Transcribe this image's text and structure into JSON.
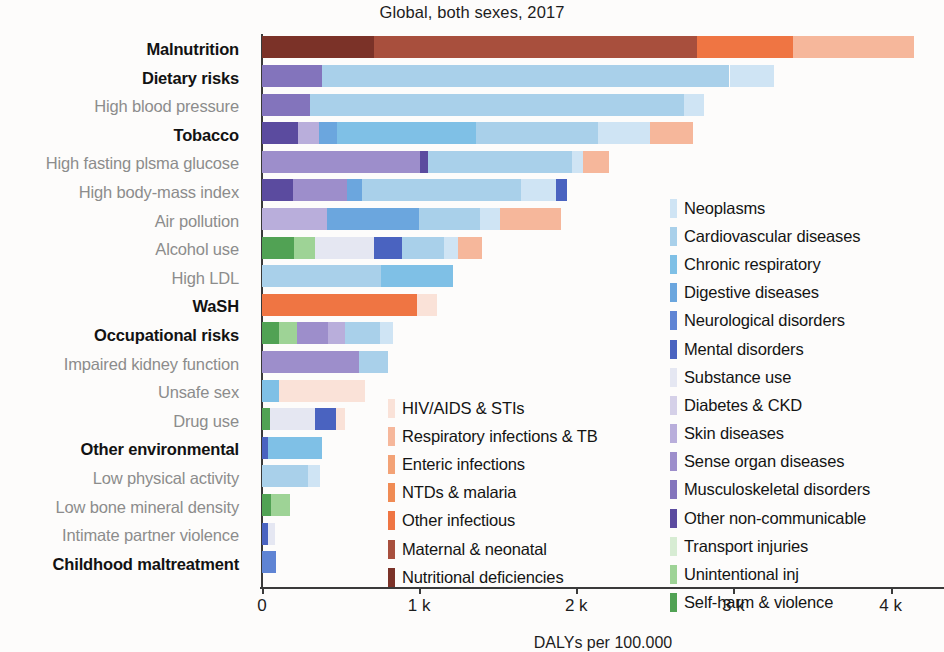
{
  "chart_data": {
    "type": "bar",
    "orientation": "horizontal",
    "stacked": true,
    "title": "Global, both sexes, 2017",
    "xlabel": "DALYs per 100.000",
    "ylabel": "",
    "xlim": [
      0,
      4340
    ],
    "xticks": [
      0,
      1000,
      2000,
      3000,
      4000
    ],
    "xticklabels": [
      "0",
      "1 k",
      "2 k",
      "3 k",
      "4 k"
    ],
    "grid": false,
    "categories": [
      "Malnutrition",
      "Dietary risks",
      "High blood pressure",
      "Tobacco",
      "High fasting plsma glucose",
      "High body-mass index",
      "Air pollution",
      "Alcohol use",
      "High LDL",
      "WaSH",
      "Occupational risks",
      "Impaired kidney function",
      "Unsafe sex",
      "Drug use",
      "Other environmental",
      "Low physical activity",
      "Low bone mineral density",
      "Intimate partner violence",
      "Childhood maltreatment"
    ],
    "category_emphasis": [
      true,
      true,
      false,
      true,
      false,
      false,
      false,
      false,
      false,
      true,
      true,
      false,
      false,
      false,
      true,
      false,
      false,
      false,
      true
    ],
    "totals": [
      4150,
      3255,
      2810,
      2740,
      2210,
      1940,
      1900,
      1400,
      1215,
      1115,
      835,
      805,
      655,
      530,
      385,
      370,
      180,
      85,
      90
    ],
    "series": [
      {
        "name": "HIV/AIDS & STIs",
        "color": "#fae2d8"
      },
      {
        "name": "Respiratory infections & TB",
        "color": "#f6b79b"
      },
      {
        "name": "Enteric infections",
        "color": "#f3a276"
      },
      {
        "name": "NTDs & malaria",
        "color": "#f08b54"
      },
      {
        "name": "Other infectious",
        "color": "#ef7543"
      },
      {
        "name": "Maternal & neonatal",
        "color": "#a84f3d"
      },
      {
        "name": "Nutritional deficiencies",
        "color": "#7b3228"
      },
      {
        "name": "Neoplasms",
        "color": "#cfe4f4"
      },
      {
        "name": "Cardiovascular diseases",
        "color": "#a9d0ea"
      },
      {
        "name": "Chronic respiratory",
        "color": "#7fc0e6"
      },
      {
        "name": "Digestive diseases",
        "color": "#6ba6de"
      },
      {
        "name": "Neurological disorders",
        "color": "#5f84d4"
      },
      {
        "name": "Mental disorders",
        "color": "#4a63c0"
      },
      {
        "name": "Substance use",
        "color": "#e5e7f2"
      },
      {
        "name": "Diabetes & CKD",
        "color": "#d5d0e8"
      },
      {
        "name": "Skin diseases",
        "color": "#b9aedb"
      },
      {
        "name": "Sense organ diseases",
        "color": "#9d8ecb"
      },
      {
        "name": "Musculoskeletal disorders",
        "color": "#8374bc"
      },
      {
        "name": "Other non-communicable",
        "color": "#5b4b9f"
      },
      {
        "name": "Transport injuries",
        "color": "#d7ecd3"
      },
      {
        "name": "Unintentional inj",
        "color": "#9ed396"
      },
      {
        "name": "Self-harm & violence",
        "color": "#51a254"
      }
    ],
    "bars": [
      {
        "category": "Malnutrition",
        "segments": [
          {
            "series": "Nutritional deficiencies",
            "value": 710
          },
          {
            "series": "Maternal & neonatal",
            "value": 2060
          },
          {
            "series": "Other infectious",
            "value": 610
          },
          {
            "series": "Respiratory infections & TB",
            "value": 770
          }
        ]
      },
      {
        "category": "Dietary risks",
        "segments": [
          {
            "series": "Musculoskeletal disorders",
            "value": 380
          },
          {
            "series": "Cardiovascular diseases",
            "value": 2595
          },
          {
            "series": "Neoplasms",
            "value": 280
          }
        ]
      },
      {
        "category": "High blood pressure",
        "segments": [
          {
            "series": "Musculoskeletal disorders",
            "value": 305
          },
          {
            "series": "Cardiovascular diseases",
            "value": 2380
          },
          {
            "series": "Neoplasms",
            "value": 125
          }
        ]
      },
      {
        "category": "Tobacco",
        "segments": [
          {
            "series": "Other non-communicable",
            "value": 230
          },
          {
            "series": "Skin diseases",
            "value": 135
          },
          {
            "series": "Digestive diseases",
            "value": 115
          },
          {
            "series": "Chronic respiratory",
            "value": 880
          },
          {
            "series": "Cardiovascular diseases",
            "value": 780
          },
          {
            "series": "Neoplasms",
            "value": 330
          },
          {
            "series": "Respiratory infections & TB",
            "value": 270
          }
        ]
      },
      {
        "category": "High fasting plsma glucose",
        "segments": [
          {
            "series": "Sense organ diseases",
            "value": 1005
          },
          {
            "series": "Other non-communicable",
            "value": 50
          },
          {
            "series": "Cardiovascular diseases",
            "value": 915
          },
          {
            "series": "Neoplasms",
            "value": 75
          },
          {
            "series": "Respiratory infections & TB",
            "value": 165
          }
        ]
      },
      {
        "category": "High body-mass index",
        "segments": [
          {
            "series": "Other non-communicable",
            "value": 195
          },
          {
            "series": "Sense organ diseases",
            "value": 345
          },
          {
            "series": "Digestive diseases",
            "value": 95
          },
          {
            "series": "Cardiovascular diseases",
            "value": 1015
          },
          {
            "series": "Neoplasms",
            "value": 220
          },
          {
            "series": "Mental disorders",
            "value": 70
          }
        ]
      },
      {
        "category": "Air pollution",
        "segments": [
          {
            "series": "Skin diseases",
            "value": 415
          },
          {
            "series": "Digestive diseases",
            "value": 585
          },
          {
            "series": "Cardiovascular diseases",
            "value": 390
          },
          {
            "series": "Neoplasms",
            "value": 125
          },
          {
            "series": "Respiratory infections & TB",
            "value": 385
          }
        ]
      },
      {
        "category": "Alcohol use",
        "segments": [
          {
            "series": "Self-harm & violence",
            "value": 205
          },
          {
            "series": "Unintentional inj",
            "value": 135
          },
          {
            "series": "Substance use",
            "value": 370
          },
          {
            "series": "Mental disorders",
            "value": 180
          },
          {
            "series": "Cardiovascular diseases",
            "value": 270
          },
          {
            "series": "Neoplasms",
            "value": 90
          },
          {
            "series": "Respiratory infections & TB",
            "value": 150
          }
        ]
      },
      {
        "category": "High LDL",
        "segments": [
          {
            "series": "Cardiovascular diseases",
            "value": 760
          },
          {
            "series": "Chronic respiratory",
            "value": 455
          }
        ]
      },
      {
        "category": "WaSH",
        "segments": [
          {
            "series": "Other infectious",
            "value": 985
          },
          {
            "series": "HIV/AIDS & STIs",
            "value": 130
          }
        ]
      },
      {
        "category": "Occupational risks",
        "segments": [
          {
            "series": "Self-harm & violence",
            "value": 105
          },
          {
            "series": "Unintentional inj",
            "value": 120
          },
          {
            "series": "Sense organ diseases",
            "value": 195
          },
          {
            "series": "Skin diseases",
            "value": 110
          },
          {
            "series": "Cardiovascular diseases",
            "value": 220
          },
          {
            "series": "Neoplasms",
            "value": 85
          }
        ]
      },
      {
        "category": "Impaired kidney function",
        "segments": [
          {
            "series": "Sense organ diseases",
            "value": 620
          },
          {
            "series": "Cardiovascular diseases",
            "value": 185
          }
        ]
      },
      {
        "category": "Unsafe sex",
        "segments": [
          {
            "series": "Chronic respiratory",
            "value": 110
          },
          {
            "series": "HIV/AIDS & STIs",
            "value": 545
          }
        ]
      },
      {
        "category": "Drug use",
        "segments": [
          {
            "series": "Self-harm & violence",
            "value": 50
          },
          {
            "series": "Substance use",
            "value": 290
          },
          {
            "series": "Mental disorders",
            "value": 130
          },
          {
            "series": "HIV/AIDS & STIs",
            "value": 60
          }
        ]
      },
      {
        "category": "Other environmental",
        "segments": [
          {
            "series": "Mental disorders",
            "value": 40
          },
          {
            "series": "Chronic respiratory",
            "value": 345
          }
        ]
      },
      {
        "category": "Low physical activity",
        "segments": [
          {
            "series": "Cardiovascular diseases",
            "value": 290
          },
          {
            "series": "Neoplasms",
            "value": 80
          }
        ]
      },
      {
        "category": "Low bone mineral density",
        "segments": [
          {
            "series": "Self-harm & violence",
            "value": 55
          },
          {
            "series": "Unintentional inj",
            "value": 125
          }
        ]
      },
      {
        "category": "Intimate partner violence",
        "segments": [
          {
            "series": "Mental disorders",
            "value": 40
          },
          {
            "series": "Substance use",
            "value": 45
          }
        ]
      },
      {
        "category": "Childhood maltreatment",
        "segments": [
          {
            "series": "Neurological disorders",
            "value": 90
          }
        ]
      }
    ],
    "legend_left": [
      "HIV/AIDS & STIs",
      "Respiratory infections & TB",
      "Enteric infections",
      "NTDs & malaria",
      "Other infectious",
      "Maternal & neonatal",
      "Nutritional deficiencies"
    ],
    "legend_right": [
      "Neoplasms",
      "Cardiovascular diseases",
      "Chronic respiratory",
      "Digestive diseases",
      "Neurological disorders",
      "Mental disorders",
      "Substance use",
      "Diabetes & CKD",
      "Skin diseases",
      "Sense organ diseases",
      "Musculoskeletal disorders",
      "Other non-communicable",
      "Transport injuries",
      "Unintentional inj",
      "Self-harm & violence"
    ]
  }
}
